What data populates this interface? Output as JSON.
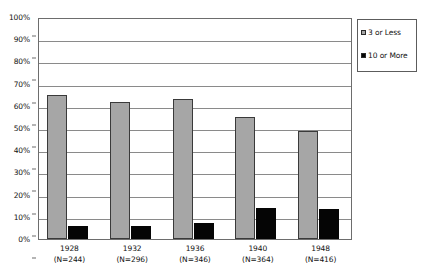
{
  "chart_data": {
    "type": "bar",
    "title": "",
    "subtitle": "",
    "xlabel": "",
    "ylabel": "",
    "ylim": [
      0,
      100
    ],
    "ytick_labels": [
      "0%",
      "10%",
      "20%",
      "30%",
      "40%",
      "50%",
      "60%",
      "70%",
      "80%",
      "90%",
      "100%"
    ],
    "ytick_values": [
      0,
      10,
      20,
      30,
      40,
      50,
      60,
      70,
      80,
      90,
      100
    ],
    "grid": "horizontal",
    "legend_position": "top-right",
    "categories": [
      "1928",
      "1932",
      "1936",
      "1940",
      "1948"
    ],
    "category_sublabels": [
      "(N=244)",
      "(N=296)",
      "(N=346)",
      "(N=364)",
      "(N=416)"
    ],
    "series": [
      {
        "name": "3 or Less",
        "color": "#a6a6a6",
        "values": [
          65,
          61.5,
          63,
          55,
          48.5
        ]
      },
      {
        "name": "10 or More",
        "color": "#050505",
        "values": [
          6,
          6,
          7,
          14,
          13.5
        ]
      }
    ]
  },
  "legend": {
    "entries": [
      {
        "label": "3 or Less"
      },
      {
        "label": "10 or More"
      }
    ]
  }
}
